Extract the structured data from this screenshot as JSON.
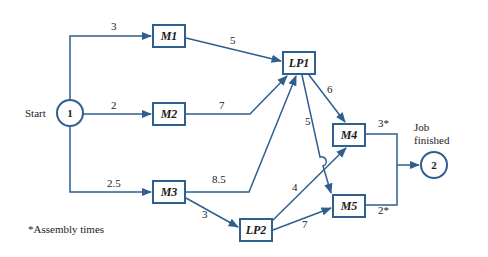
{
  "diagram": {
    "type": "activity-network",
    "start_label": "Start",
    "finish_label_line1": "Job",
    "finish_label_line2": "finished",
    "footnote": "*Assembly times",
    "accent_color": "#2f5f8e",
    "nodes": {
      "n1": {
        "label": "1"
      },
      "n2": {
        "label": "2"
      },
      "m1": {
        "label": "M1"
      },
      "m2": {
        "label": "M2"
      },
      "m3": {
        "label": "M3"
      },
      "lp1": {
        "label": "LP1"
      },
      "lp2": {
        "label": "LP2"
      },
      "m4": {
        "label": "M4"
      },
      "m5": {
        "label": "M5"
      }
    },
    "edges": {
      "n1_m1": {
        "from": "1",
        "to": "M1",
        "label": "3"
      },
      "n1_m2": {
        "from": "1",
        "to": "M2",
        "label": "2"
      },
      "n1_m3": {
        "from": "1",
        "to": "M3",
        "label": "2.5"
      },
      "m1_lp1": {
        "from": "M1",
        "to": "LP1",
        "label": "5"
      },
      "m2_lp1": {
        "from": "M2",
        "to": "LP1",
        "label": "7"
      },
      "m3_lp1": {
        "from": "M3",
        "to": "LP1",
        "label": "8.5"
      },
      "m3_lp2": {
        "from": "M3",
        "to": "LP2",
        "label": "3"
      },
      "lp1_m4": {
        "from": "LP1",
        "to": "M4",
        "label": "6"
      },
      "lp1_m5": {
        "from": "LP1",
        "to": "M5",
        "label": "5"
      },
      "lp2_m4": {
        "from": "LP2",
        "to": "M4",
        "label": "4"
      },
      "lp2_m5": {
        "from": "LP2",
        "to": "M5",
        "label": "7"
      },
      "m4_n2": {
        "from": "M4",
        "to": "2",
        "label": "3*"
      },
      "m5_n2": {
        "from": "M5",
        "to": "2",
        "label": "2*"
      }
    }
  }
}
